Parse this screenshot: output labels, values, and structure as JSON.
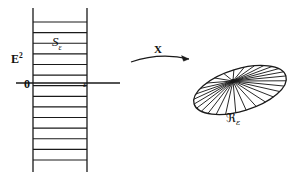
{
  "figure": {
    "domain_label": "E",
    "domain_label_superscript": "2",
    "origin_label": "0",
    "axis_point_label": "ε",
    "strip_label": "S",
    "strip_label_subscript": "ε",
    "map_label": "X",
    "image_label": "ℜ",
    "image_label_subscript": "ε",
    "stroke_color": "#1a1a1a",
    "background_color": "#ffffff"
  },
  "geometry": {
    "strip": {
      "left_x": 33,
      "right_x": 87,
      "top_y": 22,
      "bottom_y": 160,
      "vertical_line_top_y": 8,
      "vertical_line_bottom_y": 172,
      "horizontal_rung_count": 14
    },
    "axis": {
      "x_start": 16,
      "x_end": 120,
      "y": 83
    },
    "arrow": {
      "x_start": 131,
      "x_end": 189,
      "y_start": 62,
      "y_end": 59,
      "apex_y": 52
    },
    "ellipse": {
      "center_x": 240,
      "center_y": 90,
      "radius_x": 48,
      "radius_y": 21,
      "rotation_deg": -17,
      "fan_center_x": 233,
      "fan_center_y": 81,
      "spoke_count": 28
    }
  }
}
